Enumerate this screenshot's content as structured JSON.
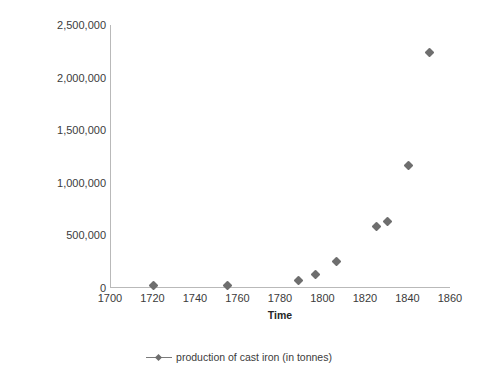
{
  "chart_data": {
    "type": "scatter",
    "title": "",
    "xlabel": "Time",
    "ylabel": "Production of cast iron (in tonnes)",
    "xlim": [
      1700,
      1860
    ],
    "ylim": [
      0,
      2500000
    ],
    "xticks": [
      1700,
      1720,
      1740,
      1760,
      1780,
      1800,
      1820,
      1840,
      1860
    ],
    "xtick_labels": [
      "1700",
      "1720",
      "1740",
      "1760",
      "1780",
      "1800",
      "1820",
      "1840",
      "1860"
    ],
    "yticks": [
      0,
      500000,
      1000000,
      1500000,
      2000000,
      2500000
    ],
    "ytick_labels": [
      "0",
      "500,000",
      "1,000,000",
      "1,500,000",
      "2,000,000",
      "2,500,000"
    ],
    "grid": false,
    "legend_position": "bottom",
    "series": [
      {
        "name": "production of cast iron (in tonnes)",
        "marker": "diamond",
        "color": "#6e6e6e",
        "x": [
          1720,
          1755,
          1788,
          1796,
          1806,
          1825,
          1830,
          1840,
          1850
        ],
        "y": [
          25000,
          28000,
          68000,
          125000,
          250000,
          580000,
          630000,
          1160000,
          2240000
        ]
      }
    ]
  },
  "legend": {
    "entries": [
      {
        "label": "production of cast iron (in tonnes)",
        "marker_name": "diamond-marker"
      }
    ]
  }
}
